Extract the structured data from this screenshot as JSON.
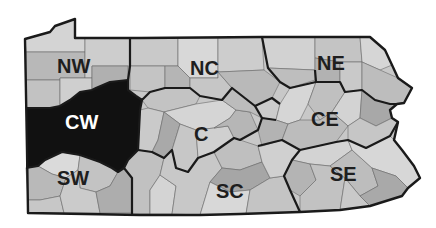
{
  "map": {
    "subject": "Pennsylvania regions",
    "colors": {
      "background": "#ffffff",
      "light": "#d6d6d6",
      "mid": "#bdbdbd",
      "dark": "#a3a3a3",
      "highlight": "#111111",
      "border": "#1a1a1a"
    },
    "regions": [
      {
        "id": "NW",
        "label": "NW",
        "highlighted": false
      },
      {
        "id": "NC",
        "label": "NC",
        "highlighted": false
      },
      {
        "id": "NE",
        "label": "NE",
        "highlighted": false
      },
      {
        "id": "CW",
        "label": "CW",
        "highlighted": true
      },
      {
        "id": "C",
        "label": "C",
        "highlighted": false
      },
      {
        "id": "CE",
        "label": "CE",
        "highlighted": false
      },
      {
        "id": "SW",
        "label": "SW",
        "highlighted": false
      },
      {
        "id": "SC",
        "label": "SC",
        "highlighted": false
      },
      {
        "id": "SE",
        "label": "SE",
        "highlighted": false
      }
    ]
  }
}
